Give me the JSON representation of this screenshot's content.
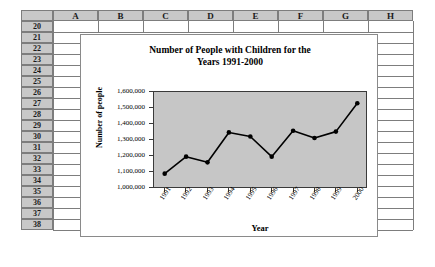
{
  "spreadsheet": {
    "column_headers": [
      "A",
      "B",
      "C",
      "D",
      "E",
      "F",
      "G",
      "H"
    ],
    "row_headers": [
      "20",
      "21",
      "22",
      "23",
      "24",
      "25",
      "26",
      "27",
      "28",
      "29",
      "30",
      "31",
      "32",
      "33",
      "34",
      "35",
      "36",
      "37",
      "38"
    ],
    "corner_label": "",
    "header_fill": "#c8c8c8",
    "gridline_color": "#7d7d7d"
  },
  "chart_data": {
    "type": "line",
    "title": "Number of People with Children for the Years 1991-2000",
    "title_line1": "Number of People with Children for the",
    "title_line2": "Years 1991-2000",
    "xlabel": "Year",
    "ylabel": "Number of people",
    "categories": [
      "1991",
      "1992",
      "1993",
      "1994",
      "1995",
      "1996",
      "1997",
      "1998",
      "1999",
      "2000"
    ],
    "values": [
      1095000,
      1200000,
      1165000,
      1350000,
      1325000,
      1200000,
      1360000,
      1315000,
      1355000,
      1530000
    ],
    "ylim": [
      1000000,
      1600000
    ],
    "ytick_labels": [
      "1,600,000",
      "1,500,000",
      "1,400,000",
      "1,300,000",
      "1,200,000",
      "1,100,000",
      "1,000,000"
    ],
    "ytick_values": [
      1600000,
      1500000,
      1400000,
      1300000,
      1200000,
      1100000,
      1000000
    ],
    "grid": false,
    "legend": "none",
    "plot_background": "#c6c6c6",
    "series_color": "#000000",
    "marker": "circle"
  }
}
